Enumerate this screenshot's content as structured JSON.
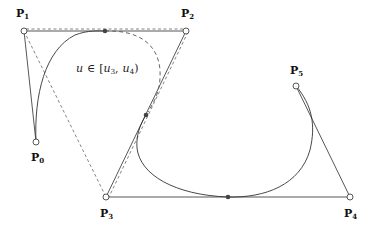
{
  "diagram": {
    "type": "B-spline curve with control polygon",
    "control_points": [
      {
        "name": "P",
        "index": "0",
        "x": 36,
        "y": 142,
        "label_x": 36,
        "label_y": 160
      },
      {
        "name": "P",
        "index": "1",
        "x": 24,
        "y": 31,
        "label_x": 22,
        "label_y": 16
      },
      {
        "name": "P",
        "index": "2",
        "x": 186,
        "y": 31,
        "label_x": 186,
        "label_y": 16
      },
      {
        "name": "P",
        "index": "3",
        "x": 106,
        "y": 197,
        "label_x": 106,
        "label_y": 216
      },
      {
        "name": "P",
        "index": "4",
        "x": 350,
        "y": 197,
        "label_x": 350,
        "label_y": 216
      },
      {
        "name": "P",
        "index": "5",
        "x": 296,
        "y": 86,
        "label_x": 296,
        "label_y": 73
      }
    ],
    "knot_points": [
      {
        "x": 105,
        "y": 31
      },
      {
        "x": 146,
        "y": 115
      },
      {
        "x": 228,
        "y": 197
      }
    ],
    "annotation": {
      "var": "u",
      "in": "∈",
      "open": "[",
      "k1": "u",
      "k1_sub": "3",
      "sep": ",",
      "k2": "u",
      "k2_sub": "4",
      "close": ")"
    },
    "colors": {
      "line": "#333333",
      "dashed": "#666666",
      "dot": "#444444"
    }
  }
}
